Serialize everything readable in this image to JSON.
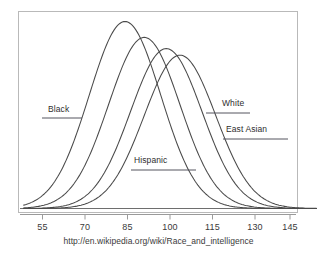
{
  "figure": {
    "source_url": "http://en.wikipedia.org/wiki/Race_and_intelligence",
    "frame_color": "#b9b9b9",
    "curve_color": "#4a4a4a",
    "axis_color": "#8c8c8c",
    "text_color": "#2e2e2e",
    "background": "#ffffff"
  },
  "chart_data": {
    "type": "line",
    "title": "",
    "subtitle": "",
    "xlabel": "",
    "ylabel": "",
    "grid": false,
    "legend_position": "inline-annotations",
    "xlim": [
      48,
      160
    ],
    "ylim": [
      0,
      1.0
    ],
    "xticks": [
      55,
      70,
      85,
      100,
      115,
      130,
      145
    ],
    "xtick_labels": [
      "55",
      "70",
      "85",
      "100",
      "115",
      "130",
      "145"
    ],
    "yticks": [],
    "ytick_labels": [],
    "series": [
      {
        "name": "Black",
        "mean": 85,
        "sd": 13,
        "peak_height": 1.0,
        "label": "Black",
        "label_x": 48,
        "label_y": 110,
        "leader_x1": 42,
        "leader_y1": 118,
        "leader_x2": 82,
        "leader_y2": 118
      },
      {
        "name": "Hispanic",
        "mean": 92,
        "sd": 13,
        "peak_height": 0.915,
        "label": "Hispanic",
        "label_x": 134,
        "label_y": 161,
        "leader_x1": 131,
        "leader_y1": 170,
        "leader_x2": 196,
        "leader_y2": 170
      },
      {
        "name": "White",
        "mean": 100,
        "sd": 13,
        "peak_height": 0.855,
        "label": "White",
        "label_x": 222,
        "label_y": 104,
        "leader_x1": 206,
        "leader_y1": 113,
        "leader_x2": 250,
        "leader_y2": 113
      },
      {
        "name": "East Asian",
        "mean": 105,
        "sd": 13,
        "peak_height": 0.82,
        "label": "East Asian",
        "label_x": 226,
        "label_y": 130,
        "leader_x1": 223,
        "leader_y1": 139,
        "leader_x2": 288,
        "leader_y2": 139
      }
    ]
  },
  "xticks": {
    "t0": "55",
    "t1": "70",
    "t2": "85",
    "t3": "100",
    "t4": "115",
    "t5": "130",
    "t6": "145"
  },
  "labels": {
    "black": "Black",
    "hispanic": "Hispanic",
    "white": "White",
    "east_asian": "East Asian"
  }
}
